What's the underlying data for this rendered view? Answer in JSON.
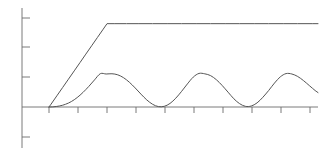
{
  "figure": {
    "width": 331,
    "height": 153,
    "background": "#ffffff",
    "title": "",
    "subtitle": ""
  },
  "axes": {
    "origin_x": 22,
    "origin_y": 107,
    "x_axis_start": 22,
    "x_axis_end": 318,
    "y_axis_top": 8,
    "y_axis_bottom": 148,
    "axis_color": "#6b6b6b",
    "axis_width": 0.9,
    "tick_length": 7,
    "x_ticks_px": [
      49,
      78,
      107,
      136,
      165,
      194,
      223,
      252,
      281,
      310
    ],
    "y_ticks_px": [
      18,
      47,
      77,
      107,
      137
    ],
    "x_tick_labels": [],
    "y_tick_labels": [],
    "grid": false,
    "legend": "none"
  },
  "chart_data": {
    "type": "line",
    "title": "",
    "subtitle": "",
    "xlabel": "",
    "ylabel": "",
    "xlim": [
      0,
      10.2
    ],
    "ylim": [
      0,
      1.2
    ],
    "grid": false,
    "legend_position": "none",
    "series": [
      {
        "name": "step-response-saturating",
        "color": "#555555",
        "linewidth": 1.0,
        "description": "Linear ramp from origin rising to a constant saturated plateau",
        "x": [
          0.93,
          1.0,
          1.2,
          1.4,
          1.6,
          1.8,
          2.0,
          2.2,
          2.4,
          2.6,
          2.8,
          2.93,
          3.2,
          3.6,
          4.0,
          4.5,
          5.0,
          5.5,
          6.0,
          6.5,
          7.0,
          7.5,
          8.0,
          8.5,
          9.0,
          9.5,
          10.0,
          10.2
        ],
        "y": [
          0.0,
          0.034,
          0.135,
          0.236,
          0.337,
          0.438,
          0.539,
          0.641,
          0.742,
          0.843,
          0.944,
          1.01,
          1.01,
          1.01,
          1.01,
          1.01,
          1.01,
          1.01,
          1.01,
          1.01,
          1.01,
          1.01,
          1.01,
          1.01,
          1.01,
          1.01,
          1.01,
          1.01
        ]
      },
      {
        "name": "oscillatory-response",
        "color": "#555555",
        "linewidth": 1.0,
        "description": "Damped-start sinusoidal oscillation, three crests, troughs near baseline",
        "x": [
          0.93,
          1.1,
          1.3,
          1.5,
          1.7,
          1.9,
          2.1,
          2.3,
          2.5,
          2.7,
          2.9,
          3.1,
          3.3,
          3.5,
          3.7,
          3.9,
          4.1,
          4.3,
          4.5,
          4.7,
          4.9,
          5.1,
          5.3,
          5.5,
          5.7,
          5.9,
          6.1,
          6.3,
          6.5,
          6.7,
          6.9,
          7.1,
          7.3,
          7.5,
          7.7,
          7.9,
          8.1,
          8.3,
          8.5,
          8.7,
          8.9,
          9.1,
          9.3,
          9.5,
          9.7,
          9.9,
          10.1,
          10.2
        ],
        "y": [
          0.0,
          0.003,
          0.013,
          0.033,
          0.066,
          0.114,
          0.176,
          0.249,
          0.329,
          0.404,
          0.4,
          0.403,
          0.39,
          0.355,
          0.3,
          0.231,
          0.156,
          0.086,
          0.033,
          0.005,
          0.008,
          0.043,
          0.107,
          0.19,
          0.28,
          0.362,
          0.407,
          0.402,
          0.38,
          0.33,
          0.26,
          0.18,
          0.1,
          0.04,
          0.008,
          0.012,
          0.05,
          0.118,
          0.2,
          0.29,
          0.365,
          0.405,
          0.4,
          0.37,
          0.32,
          0.26,
          0.2,
          0.175
        ]
      }
    ]
  }
}
